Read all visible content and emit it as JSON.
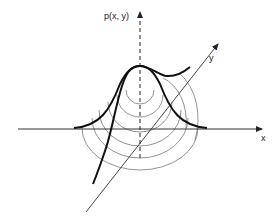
{
  "diagram": {
    "labels": {
      "z_axis": "p(x, y)",
      "y_axis": "y",
      "x_axis": "x"
    },
    "colors": {
      "curve": "#111111",
      "contour": "#666666",
      "axis": "#333333",
      "background": "#ffffff"
    }
  }
}
